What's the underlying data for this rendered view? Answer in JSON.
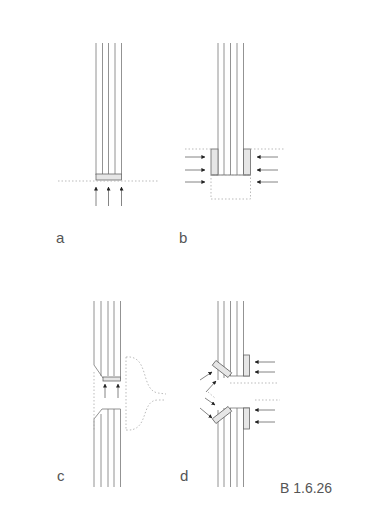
{
  "figure": {
    "caption": "B 1.6.26",
    "panels": [
      {
        "id": "a",
        "label": "a"
      },
      {
        "id": "b",
        "label": "b"
      },
      {
        "id": "c",
        "label": "c"
      },
      {
        "id": "d",
        "label": "d"
      }
    ]
  },
  "colors": {
    "line": "#666666",
    "plate_fill": "#e4e4e4",
    "dotted": "#aaaaaa",
    "arrow": "#222222",
    "text": "#555555"
  }
}
